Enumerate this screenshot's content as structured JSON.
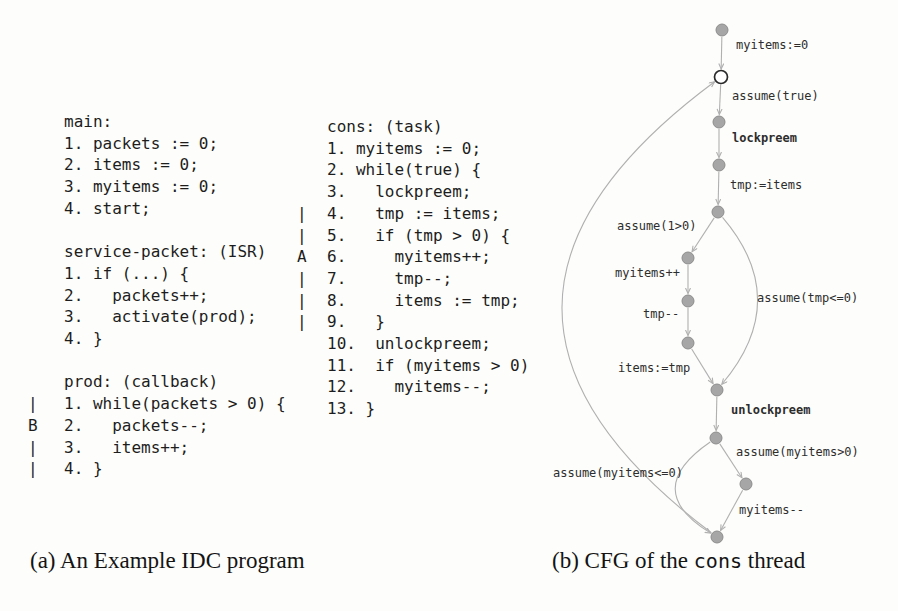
{
  "captions": {
    "a": "(a) An Example IDC program",
    "b_prefix": "(b) CFG of the ",
    "b_mono": "cons",
    "b_suffix": " thread"
  },
  "code_left": {
    "lines": [
      {
        "m": "",
        "t": "main:"
      },
      {
        "m": "",
        "t": "1. packets := 0;"
      },
      {
        "m": "",
        "t": "2. items := 0;"
      },
      {
        "m": "",
        "t": "3. myitems := 0;"
      },
      {
        "m": "",
        "t": "4. start;"
      },
      {
        "m": "",
        "t": ""
      },
      {
        "m": "",
        "t": "service-packet: (ISR)"
      },
      {
        "m": "",
        "t": "1. if (...) {"
      },
      {
        "m": "",
        "t": "2.   packets++;"
      },
      {
        "m": "",
        "t": "3.   activate(prod);"
      },
      {
        "m": "",
        "t": "4. }"
      },
      {
        "m": "",
        "t": ""
      },
      {
        "m": "",
        "t": "prod: (callback)"
      },
      {
        "m": "|",
        "t": "1. while(packets > 0) {"
      },
      {
        "m": "B",
        "t": "2.   packets--;"
      },
      {
        "m": "|",
        "t": "3.   items++;"
      },
      {
        "m": "|",
        "t": "4. }"
      }
    ]
  },
  "code_right": {
    "lines": [
      {
        "m": "",
        "t": "cons: (task)"
      },
      {
        "m": "",
        "t": "1. myitems := 0;"
      },
      {
        "m": "",
        "t": "2. while(true) {"
      },
      {
        "m": "",
        "t": "3.   lockpreem;"
      },
      {
        "m": "|",
        "t": "4.   tmp := items;"
      },
      {
        "m": "|",
        "t": "5.   if (tmp > 0) {"
      },
      {
        "m": "A",
        "t": "6.     myitems++;"
      },
      {
        "m": "|",
        "t": "7.     tmp--;"
      },
      {
        "m": "|",
        "t": "8.     items := tmp;"
      },
      {
        "m": "|",
        "t": "9.   }"
      },
      {
        "m": "",
        "t": "10.  unlockpreem;"
      },
      {
        "m": "",
        "t": "11.  if (myitems > 0)"
      },
      {
        "m": "",
        "t": "12.    myitems--;"
      },
      {
        "m": "",
        "t": "13. }"
      }
    ]
  },
  "cfg": {
    "nodes": [
      {
        "id": "n0",
        "x": 722,
        "y": 30,
        "type": "filled"
      },
      {
        "id": "n1",
        "x": 721,
        "y": 77,
        "type": "open"
      },
      {
        "id": "n2",
        "x": 719,
        "y": 122,
        "type": "filled"
      },
      {
        "id": "n3",
        "x": 719,
        "y": 165,
        "type": "filled"
      },
      {
        "id": "n4",
        "x": 718,
        "y": 212,
        "type": "filled"
      },
      {
        "id": "n5",
        "x": 688,
        "y": 258,
        "type": "filled"
      },
      {
        "id": "n6",
        "x": 688,
        "y": 301,
        "type": "filled"
      },
      {
        "id": "n7",
        "x": 688,
        "y": 343,
        "type": "filled"
      },
      {
        "id": "n8",
        "x": 717,
        "y": 390,
        "type": "filled"
      },
      {
        "id": "n9",
        "x": 716,
        "y": 438,
        "type": "filled"
      },
      {
        "id": "n10",
        "x": 746,
        "y": 484,
        "type": "filled"
      },
      {
        "id": "n11",
        "x": 717,
        "y": 537,
        "type": "filled"
      }
    ],
    "edges": [
      {
        "from": "n0",
        "to": "n1",
        "label": "myitems:=0",
        "lx": 736,
        "ly": 38
      },
      {
        "from": "n1",
        "to": "n2",
        "label": "assume(true)",
        "lx": 732,
        "ly": 89
      },
      {
        "from": "n2",
        "to": "n3",
        "label": "lockpreem",
        "lx": 732,
        "ly": 131,
        "bold": true
      },
      {
        "from": "n3",
        "to": "n4",
        "label": "tmp:=items",
        "lx": 730,
        "ly": 178
      },
      {
        "from": "n4",
        "to": "n5",
        "label": "assume(1>0)",
        "lx": 617,
        "ly": 219
      },
      {
        "from": "n5",
        "to": "n6",
        "label": "myitems++",
        "lx": 615,
        "ly": 266
      },
      {
        "from": "n6",
        "to": "n7",
        "label": "tmp--",
        "lx": 643,
        "ly": 307
      },
      {
        "from": "n7",
        "to": "n8",
        "label": "items:=tmp",
        "lx": 618,
        "ly": 361
      },
      {
        "from": "n4",
        "to": "n8",
        "label": "assume(tmp<=0)",
        "lx": 757,
        "ly": 291,
        "cx": 793,
        "cy": 300
      },
      {
        "from": "n8",
        "to": "n9",
        "label": "unlockpreem",
        "lx": 731,
        "ly": 403,
        "bold": true
      },
      {
        "from": "n9",
        "to": "n10",
        "label": "assume(myitems>0)",
        "lx": 736,
        "ly": 445
      },
      {
        "from": "n10",
        "to": "n11",
        "label": "myitems--",
        "lx": 739,
        "ly": 503
      },
      {
        "from": "n9",
        "to": "n11",
        "label": "assume(myitems<=0)",
        "lx": 553,
        "ly": 466,
        "cx": 640,
        "cy": 490
      },
      {
        "from": "n11",
        "to": "n1",
        "label": "",
        "cx": 411,
        "cy": 307
      }
    ]
  },
  "colors": {
    "node_fill": "#a6a6a6",
    "node_stroke": "#8d8d8d",
    "open_fill": "#ffffff",
    "open_stroke": "#2a2a2a",
    "edge": "#b0b0b0",
    "label": "#2d2d2d"
  }
}
